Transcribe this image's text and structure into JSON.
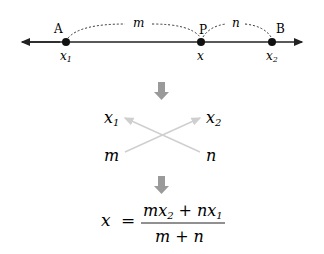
{
  "number_line": {
    "points": [
      {
        "label": "A",
        "coord": "x",
        "sub": "1"
      },
      {
        "label": "P",
        "coord": "x",
        "sub": ""
      },
      {
        "label": "B",
        "coord": "x",
        "sub": "2"
      }
    ],
    "arcs": [
      {
        "label": "m",
        "from": "A",
        "to": "P"
      },
      {
        "label": "n",
        "from": "P",
        "to": "B"
      }
    ]
  },
  "cross": {
    "top_left": {
      "base": "x",
      "sub": "1"
    },
    "top_right": {
      "base": "x",
      "sub": "2"
    },
    "bottom_left": "m",
    "bottom_right": "n"
  },
  "formula": {
    "lhs": "x",
    "equals": "=",
    "num_m": "m",
    "num_x": "x",
    "num_x_sub": "2",
    "plus": "+",
    "num_n": "n",
    "num_x2": "x",
    "num_x2_sub": "1",
    "den_m": "m",
    "den_plus": "+",
    "den_n": "n"
  },
  "colors": {
    "line": "#222222",
    "arrow_down": "#9a9a9a",
    "cross_arrows": "#cccccc"
  }
}
